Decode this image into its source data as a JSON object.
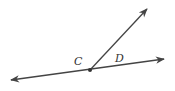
{
  "diagram": {
    "labels": {
      "point_c": "C",
      "point_d": "D"
    },
    "colors": {
      "stroke": "#444444",
      "background": "#ffffff"
    },
    "elements": [
      {
        "type": "line",
        "from": [
          10,
          80
        ],
        "to": [
          165,
          59
        ],
        "arrows": "both"
      },
      {
        "type": "ray",
        "from": [
          90,
          70
        ],
        "to": [
          148,
          8
        ],
        "arrows": "end"
      },
      {
        "type": "point",
        "name": "C",
        "at": [
          90,
          70
        ]
      }
    ]
  }
}
